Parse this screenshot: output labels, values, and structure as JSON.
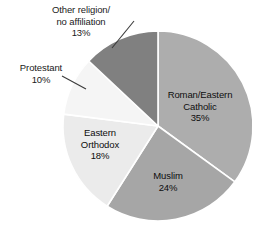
{
  "chart_data": {
    "type": "pie",
    "title": "",
    "subtitle": "",
    "xlabel": "",
    "ylabel": "",
    "legend_position": "none",
    "grid": false,
    "start_angle_deg": 0,
    "direction": "clockwise",
    "categories": [
      "Roman/Eastern Catholic",
      "Muslim",
      "Eastern Orthodox",
      "Protestant",
      "Other religion/no affiliation"
    ],
    "values": [
      35,
      24,
      18,
      10,
      13
    ],
    "value_unit": "%",
    "slices": [
      {
        "label": "Roman/Eastern",
        "label_line2": "Catholic",
        "value_text": "35%",
        "value": 35,
        "color": "#adadad",
        "label_placement": "inside"
      },
      {
        "label": "Muslim",
        "label_line2": "",
        "value_text": "24%",
        "value": 24,
        "color": "#a6a6a6",
        "label_placement": "inside"
      },
      {
        "label": "Eastern",
        "label_line2": "Orthodox",
        "value_text": "18%",
        "value": 18,
        "color": "#ebebeb",
        "label_placement": "inside"
      },
      {
        "label": "Protestant",
        "label_line2": "",
        "value_text": "10%",
        "value": 10,
        "color": "#f5f5f5",
        "label_placement": "outside"
      },
      {
        "label": "Other religion/",
        "label_line2": "no affiliation",
        "value_text": "13%",
        "value": 13,
        "color": "#808080",
        "label_placement": "outside"
      }
    ],
    "colors": {
      "background": "#ffffff",
      "separator": "#ffffff",
      "text": "#1a1a1a",
      "leader_line": "#3a3a3a"
    }
  },
  "labels": {
    "other_line1": "Other religion/",
    "other_line2": "no affiliation",
    "other_value": "13%",
    "protestant_line1": "Protestant",
    "protestant_value": "10%",
    "catholic_line1": "Roman/Eastern",
    "catholic_line2": "Catholic",
    "catholic_value": "35%",
    "orthodox_line1": "Eastern",
    "orthodox_line2": "Orthodox",
    "orthodox_value": "18%",
    "muslim_line1": "Muslim",
    "muslim_value": "24%"
  }
}
